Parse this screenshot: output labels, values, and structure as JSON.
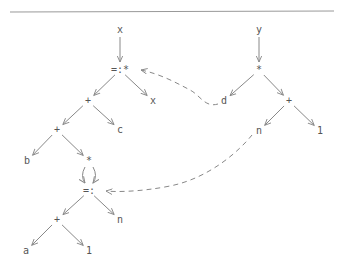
{
  "diagram": {
    "type": "expression-tree-dag",
    "nodes": [
      {
        "id": "x_root",
        "label": "x",
        "x": 120,
        "y": 30
      },
      {
        "id": "assign_mul",
        "label": "=:*",
        "x": 120,
        "y": 70
      },
      {
        "id": "x_leaf",
        "label": "x",
        "x": 153,
        "y": 101
      },
      {
        "id": "plus1",
        "label": "+",
        "x": 88,
        "y": 101
      },
      {
        "id": "plus2",
        "label": "+",
        "x": 57,
        "y": 130
      },
      {
        "id": "c",
        "label": "c",
        "x": 120,
        "y": 130
      },
      {
        "id": "b",
        "label": "b",
        "x": 27,
        "y": 161
      },
      {
        "id": "mul2",
        "label": "*",
        "x": 89,
        "y": 161
      },
      {
        "id": "assign",
        "label": "=:",
        "x": 89,
        "y": 191
      },
      {
        "id": "plus3",
        "label": "+",
        "x": 57,
        "y": 220
      },
      {
        "id": "n_left",
        "label": "n",
        "x": 120,
        "y": 220
      },
      {
        "id": "a",
        "label": "a",
        "x": 26,
        "y": 251
      },
      {
        "id": "one_left",
        "label": "1",
        "x": 89,
        "y": 251
      },
      {
        "id": "y_root",
        "label": "y",
        "x": 259,
        "y": 30
      },
      {
        "id": "mul_right",
        "label": "*",
        "x": 259,
        "y": 70
      },
      {
        "id": "d",
        "label": "d",
        "x": 224,
        "y": 101
      },
      {
        "id": "plus_right",
        "label": "+",
        "x": 289,
        "y": 101
      },
      {
        "id": "n_right",
        "label": "n",
        "x": 259,
        "y": 131
      },
      {
        "id": "one_right",
        "label": "1",
        "x": 320,
        "y": 131
      }
    ],
    "edges": [
      [
        "x_root",
        "assign_mul"
      ],
      [
        "assign_mul",
        "plus1"
      ],
      [
        "assign_mul",
        "x_leaf"
      ],
      [
        "plus1",
        "plus2"
      ],
      [
        "plus1",
        "c"
      ],
      [
        "plus2",
        "b"
      ],
      [
        "plus2",
        "mul2"
      ],
      [
        "mul2",
        "assign"
      ],
      [
        "assign",
        "plus3"
      ],
      [
        "assign",
        "n_left"
      ],
      [
        "plus3",
        "a"
      ],
      [
        "plus3",
        "one_left"
      ],
      [
        "y_root",
        "mul_right"
      ],
      [
        "mul_right",
        "d"
      ],
      [
        "mul_right",
        "plus_right"
      ],
      [
        "plus_right",
        "n_right"
      ],
      [
        "plus_right",
        "one_right"
      ]
    ],
    "dashed_links": [
      {
        "from": "d",
        "to": "assign_mul"
      },
      {
        "from": "n_right",
        "to": "assign"
      }
    ],
    "colors": {
      "line": "#888888",
      "text": "#555555",
      "rule": "#999999"
    }
  }
}
